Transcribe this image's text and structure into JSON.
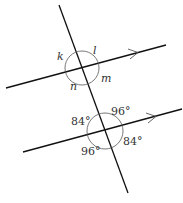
{
  "diagram": {
    "top_intersection": {
      "labels": {
        "k": "k",
        "l": "l",
        "m": "m",
        "n": "n"
      }
    },
    "bottom_intersection": {
      "labels": {
        "top_left": "84°",
        "top_right": "96°",
        "bottom_left": "96°",
        "bottom_right": "84°"
      }
    },
    "colors": {
      "line": "#111111",
      "arc": "#555555",
      "text": "#333333"
    }
  }
}
